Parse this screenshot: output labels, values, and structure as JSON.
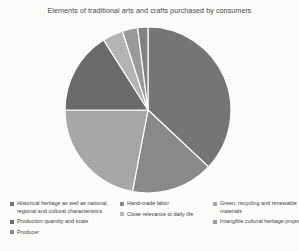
{
  "chart_title": "Elements of traditional arts and crafts purchased by consumers",
  "chart_data": {
    "type": "pie",
    "title": "Elements of traditional arts and crafts purchased by consumers",
    "xlabel": "",
    "ylabel": "",
    "grid": false,
    "legend_position": "bottom",
    "start_angle_deg": -90,
    "direction": "clockwise",
    "categories": [
      "Historical heritage as well as national, regional and cultural characteristics",
      "Hand-made labor",
      "Green, recycling and renewable materials",
      "Production quantity and scale",
      "Close relevance to daily life",
      "Intangible cultural heritage project",
      "Producer"
    ],
    "values": [
      37,
      16,
      22,
      16,
      4,
      3,
      2
    ],
    "colors": [
      "#767676",
      "#8a8a8a",
      "#a8a8a8",
      "#6b6b6b",
      "#b5b5b5",
      "#9b9b9b",
      "#838383"
    ],
    "slice_separator_color": "#ffffff"
  },
  "legend": {
    "columns": [
      {
        "items": [
          {
            "label": "Historical heritage as well as national, regional and cultural characteristics",
            "color": "#767676"
          },
          {
            "label": "Production quantity and scale",
            "color": "#6b6b6b"
          },
          {
            "label": "Producer",
            "color": "#838383"
          }
        ]
      },
      {
        "items": [
          {
            "label": "Hand-made labor",
            "color": "#8a8a8a"
          },
          {
            "label": "Close relevance to daily life",
            "color": "#b5b5b5"
          }
        ]
      },
      {
        "items": [
          {
            "label": "Green, recycling and renewable materials",
            "color": "#a8a8a8"
          },
          {
            "label": "Intangible cultural heritage project",
            "color": "#9b9b9b"
          }
        ]
      }
    ]
  }
}
